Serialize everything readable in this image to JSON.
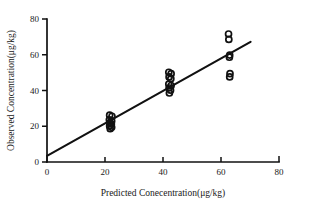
{
  "chart_data": {
    "type": "scatter",
    "title": "",
    "xlabel": "Predicted Conecentration(μg/kg)",
    "ylabel": "Observed Concentration(μg/kg)",
    "xlim": [
      0,
      80
    ],
    "ylim": [
      0,
      80
    ],
    "xticks": [
      0,
      20,
      40,
      60,
      80
    ],
    "yticks": [
      0,
      20,
      40,
      60,
      80
    ],
    "xtick_labels": [
      "0",
      "20",
      "40",
      "60",
      "80"
    ],
    "ytick_labels": [
      "0",
      "20",
      "40",
      "60",
      "80"
    ],
    "grid": false,
    "legend": null,
    "marker": "open-circle",
    "series": [
      {
        "name": "Observed vs Predicted",
        "marker": "open-circle",
        "points": [
          {
            "x": 21.6,
            "y": 26.2
          },
          {
            "x": 22.4,
            "y": 25.6
          },
          {
            "x": 21.5,
            "y": 23.6
          },
          {
            "x": 22.3,
            "y": 23.0
          },
          {
            "x": 21.7,
            "y": 22.0
          },
          {
            "x": 22.2,
            "y": 21.2
          },
          {
            "x": 21.6,
            "y": 20.2
          },
          {
            "x": 22.3,
            "y": 19.4
          },
          {
            "x": 21.8,
            "y": 18.6
          },
          {
            "x": 42.0,
            "y": 50.2
          },
          {
            "x": 42.8,
            "y": 49.4
          },
          {
            "x": 42.1,
            "y": 47.6
          },
          {
            "x": 42.7,
            "y": 46.6
          },
          {
            "x": 42.0,
            "y": 43.6
          },
          {
            "x": 42.8,
            "y": 42.8
          },
          {
            "x": 42.1,
            "y": 41.4
          },
          {
            "x": 42.6,
            "y": 40.2
          },
          {
            "x": 42.2,
            "y": 38.6
          },
          {
            "x": 62.6,
            "y": 71.6
          },
          {
            "x": 62.7,
            "y": 68.6
          },
          {
            "x": 63.0,
            "y": 59.8
          },
          {
            "x": 62.9,
            "y": 58.6
          },
          {
            "x": 63.1,
            "y": 49.4
          },
          {
            "x": 63.0,
            "y": 47.6
          }
        ]
      }
    ],
    "fit_line": {
      "name": "regression-line",
      "x_start": 0.0,
      "y_start": 3.4,
      "x_end": 70.2,
      "y_end": 67.2
    }
  }
}
